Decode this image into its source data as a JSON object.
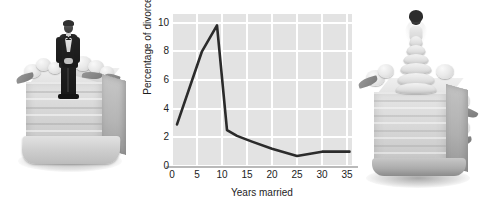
{
  "figure": {
    "background_color": "#ffffff",
    "width": 484,
    "height": 208
  },
  "left_photo": {
    "name": "groom-cake-photo",
    "subject": "groom figurine standing on a white tiered wedding cake with sugar flowers",
    "style": "grayscale photograph"
  },
  "right_photo": {
    "name": "bride-cake-photo",
    "subject": "bride figurine in ruffled gown on a white wedding cake with sugar flowers",
    "style": "grayscale photograph"
  },
  "chart_data": {
    "type": "line",
    "title": "",
    "xlabel": "Years married",
    "ylabel": "Percentage of divorces",
    "xlim": [
      0,
      36
    ],
    "ylim": [
      0,
      10.6
    ],
    "xticks": [
      0,
      5,
      10,
      15,
      20,
      25,
      30,
      35
    ],
    "yticks": [
      0,
      2,
      4,
      6,
      8,
      10
    ],
    "xtick_labels": [
      "0",
      "5",
      "10",
      "15",
      "20",
      "25",
      "30",
      "35"
    ],
    "ytick_labels": [
      "0",
      "2",
      "4",
      "6",
      "8",
      "10"
    ],
    "grid": true,
    "grid_color": "#ffffff",
    "plot_bgcolor": "#e3e3e3",
    "line_color": "#2b2b2b",
    "line_width": 2.6,
    "legend": null,
    "series": [
      {
        "name": "Percentage of divorces",
        "x": [
          1,
          6,
          9,
          11,
          13,
          16,
          20,
          25,
          30,
          33,
          35.5
        ],
        "y": [
          2.9,
          8.0,
          9.8,
          2.5,
          2.1,
          1.7,
          1.2,
          0.7,
          1.0,
          1.0,
          1.0
        ]
      }
    ]
  }
}
